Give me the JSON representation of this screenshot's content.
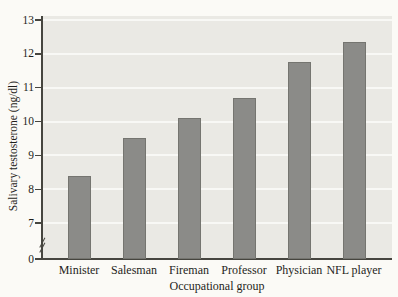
{
  "chart_data": {
    "type": "bar",
    "title": "",
    "categories": [
      "Minister",
      "Salesman",
      "Fireman",
      "Professor",
      "Physician",
      "NFL player"
    ],
    "values": [
      8.4,
      9.5,
      10.1,
      10.7,
      11.75,
      12.35
    ],
    "xlabel": "Occupational group",
    "ylabel": "Salivary testosterone (ng/dl)",
    "y_ticks": [
      13,
      12,
      11,
      10,
      9,
      8,
      7
    ],
    "y_origin_label": "0",
    "axis_break": true,
    "ylim_display": [
      7,
      13
    ],
    "grid": true,
    "legend": "none",
    "colors": {
      "bar": "#8b8b88",
      "plot_bg": "#eae9e4",
      "grid": "#f8f8f5",
      "axis": "#46453f",
      "text": "#1f1e1b",
      "page_bg": "#fbfaf6"
    }
  }
}
